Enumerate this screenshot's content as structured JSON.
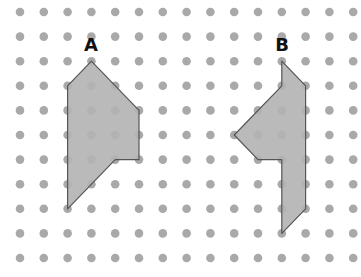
{
  "grid": {
    "cols": 15,
    "rows": 11,
    "origin_x": 20,
    "origin_y": 12,
    "spacing_x": 23.8,
    "spacing_y": 24.6,
    "dot_radius": 4.3,
    "dot_color": "#a9a9a9"
  },
  "shapes": [
    {
      "label": "A",
      "label_pos": [
        91,
        51
      ],
      "fill": "#b3b3b3",
      "stroke": "#555555",
      "vertices_grid": [
        [
          3,
          2
        ],
        [
          5,
          4
        ],
        [
          5,
          6
        ],
        [
          4,
          6
        ],
        [
          2,
          8
        ],
        [
          2,
          3
        ]
      ]
    },
    {
      "label": "B",
      "label_pos": [
        282,
        51
      ],
      "fill": "#b3b3b3",
      "stroke": "#555555",
      "vertices_grid": [
        [
          11,
          2
        ],
        [
          12,
          3
        ],
        [
          12,
          8
        ],
        [
          11,
          9
        ],
        [
          11,
          6
        ],
        [
          10,
          6
        ],
        [
          9,
          5
        ],
        [
          11,
          3
        ]
      ]
    }
  ]
}
